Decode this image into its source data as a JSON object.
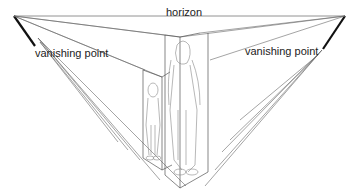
{
  "diagram": {
    "type": "two-point perspective",
    "labels": {
      "horizon": "horizon",
      "vanishing_point_left": "vanishing point",
      "vanishing_point_right": "vanishing point"
    },
    "colors": {
      "background": "#ffffff",
      "line": "#555555",
      "marker": "#111111",
      "text": "#222222"
    }
  }
}
